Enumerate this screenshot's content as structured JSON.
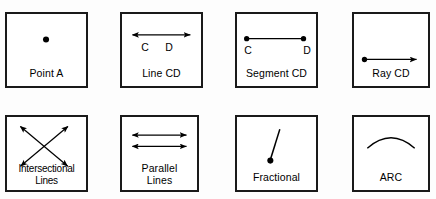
{
  "figure": {
    "background_color": "#fdfdfd",
    "panel_border_color": "#1a1a1a",
    "ink_color": "#000000"
  },
  "panels": [
    {
      "id": "point-a",
      "caption": "Point A",
      "figure_type": "point",
      "labels": []
    },
    {
      "id": "line-cd",
      "caption": "Line CD",
      "figure_type": "double-arrow-line",
      "labels": [
        "C",
        "D"
      ]
    },
    {
      "id": "segment-cd",
      "caption": "Segment CD",
      "figure_type": "segment-with-endpoints",
      "labels": [
        "C",
        "D"
      ]
    },
    {
      "id": "ray-cd",
      "caption": "Ray CD",
      "figure_type": "ray",
      "labels": []
    },
    {
      "id": "intersectional-lines",
      "caption": "Intersectional\nLines",
      "figure_type": "crossed-double-arrow-lines",
      "labels": []
    },
    {
      "id": "parallel-lines",
      "caption": "Parallel\nLines",
      "figure_type": "two-parallel-double-arrow-lines",
      "labels": []
    },
    {
      "id": "fractional",
      "caption": "Fractional",
      "figure_type": "point-with-slanted-segment",
      "labels": []
    },
    {
      "id": "arc",
      "caption": "ARC",
      "figure_type": "arc-curve",
      "labels": []
    }
  ]
}
